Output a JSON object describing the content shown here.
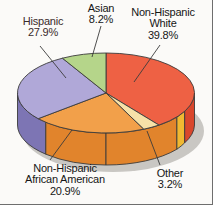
{
  "chart_data": {
    "type": "pie",
    "title": "",
    "subtitle": "",
    "xlabel": "",
    "ylabel": "",
    "legend_position": "none",
    "grid": false,
    "style": "3d-exploded-disc",
    "units": "percent",
    "categories": [
      "Non-Hispanic White",
      "Other",
      "Non-Hispanic African American",
      "Hispanic",
      "Asian"
    ],
    "values": [
      39.8,
      3.2,
      20.9,
      27.9,
      8.2
    ],
    "slices": [
      {
        "name": "non-hispanic-white",
        "label_line1": "Non-Hispanic",
        "label_line2": "White",
        "value": 39.8,
        "value_text": "39.8%",
        "color": "#ee6144",
        "side_color": "#d9462c",
        "start_deg": 0.0,
        "end_deg": 143.28
      },
      {
        "name": "other",
        "label_line1": "Other",
        "label_line2": "",
        "value": 3.2,
        "value_text": "3.2%",
        "color": "#f7e2a8",
        "side_color": "#f0b832",
        "start_deg": 143.28,
        "end_deg": 154.8
      },
      {
        "name": "non-hispanic-african-american",
        "label_line1": "Non-Hispanic",
        "label_line2": "African American",
        "value": 20.9,
        "value_text": "20.9%",
        "color": "#f2a04a",
        "side_color": "#e1842c",
        "start_deg": 154.8,
        "end_deg": 230.04
      },
      {
        "name": "hispanic",
        "label_line1": "Hispanic",
        "label_line2": "",
        "value": 27.9,
        "value_text": "27.9%",
        "color": "#b0a8d8",
        "side_color": "#7d75b4",
        "start_deg": 230.04,
        "end_deg": 330.48
      },
      {
        "name": "asian",
        "label_line1": "Asian",
        "label_line2": "",
        "value": 8.2,
        "value_text": "8.2%",
        "color": "#b5d58a",
        "side_color": "#98bd6a",
        "start_deg": 330.48,
        "end_deg": 360.0
      }
    ]
  },
  "colors": {
    "background": "#fbfaf8",
    "border": "#6e6e6e",
    "outline": "#3b3b3b",
    "shadow": "#c9c7c3",
    "label_text": "#161616",
    "leader_line": "#3b3b3b"
  }
}
